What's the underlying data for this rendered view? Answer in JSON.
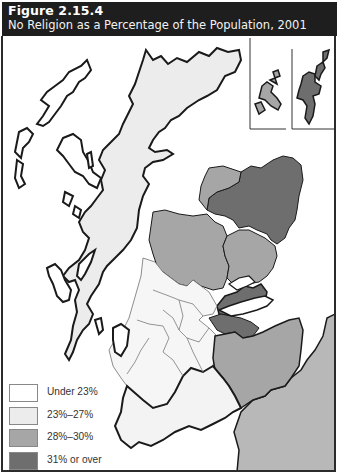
{
  "header": {
    "figure_number": "Figure 2.15.4",
    "title": "No Religion as a Percentage of the Population, 2001"
  },
  "colors": {
    "header_bg": "#1e1e1e",
    "under_23": "#ffffff",
    "23_27": "#ececec",
    "28_30": "#a6a6a6",
    "31_over": "#6e6e6e",
    "outside_region": "#b8b8b8",
    "border": "#1a1a1a"
  },
  "legend": {
    "items": [
      {
        "label": "Under 23%",
        "color": "#ffffff"
      },
      {
        "label": "23%–27%",
        "color": "#ececec"
      },
      {
        "label": "28%–30%",
        "color": "#a6a6a6"
      },
      {
        "label": "31% or over",
        "color": "#6e6e6e"
      }
    ]
  },
  "map": {
    "region": "Scotland",
    "insets": [
      "Orkney",
      "Shetland"
    ]
  }
}
